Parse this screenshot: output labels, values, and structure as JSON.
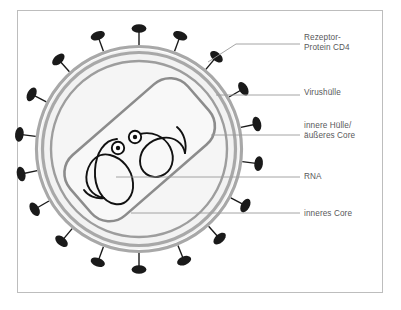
{
  "figure": {
    "frame": {
      "border_color": "#bdbdbd",
      "background": "#ffffff"
    }
  },
  "colors": {
    "envelope_gray": "#a8a8a8",
    "inner_ring_gray": "#9d9d9d",
    "core_gray": "#8c8c8c",
    "spike_black": "#1a1a1a",
    "cytoplasm_fill": "#f2f2f2",
    "core_fill": "#f7f7f7",
    "leader_line": "#9a9a9a",
    "text_gray": "#58585a"
  },
  "labels": [
    {
      "id": "cd4",
      "name": "receptor-protein-cd4",
      "text": "Rezeptor-\nProtein CD4"
    },
    {
      "id": "envelope",
      "name": "virus-envelope",
      "text": "Virushülle"
    },
    {
      "id": "inner",
      "name": "inner-envelope-outer-core",
      "text": "innere Hülle/\näußeres Core"
    },
    {
      "id": "rna",
      "name": "rna",
      "text": "RNA"
    },
    {
      "id": "core",
      "name": "inner-core",
      "text": "inneres Core"
    }
  ],
  "structure": {
    "center": {
      "x": 139,
      "y": 149
    },
    "envelope_outer_radius": 104,
    "envelope_inner_radius": 97,
    "inner_ring_radius": 88,
    "core_rotation_deg": -41,
    "spike_count": 18,
    "spike_label": "Rezeptor-Protein CD4 spike",
    "rna_strand_count": 2,
    "enzyme_dot_count": 2
  },
  "leaders": [
    {
      "id": "cd4",
      "type": "bent",
      "anchor_x": 208,
      "anchor_y": 62,
      "end_x": 300,
      "end_y": 36
    },
    {
      "id": "envelope",
      "type": "horizontal",
      "anchor_x": 216,
      "anchor_y": 95,
      "end_x": 300,
      "end_y": 95
    },
    {
      "id": "inner",
      "type": "horizontal",
      "anchor_x": 211,
      "anchor_y": 135,
      "end_x": 300,
      "end_y": 135
    },
    {
      "id": "rna",
      "type": "horizontal",
      "anchor_x": 116,
      "anchor_y": 177,
      "end_x": 300,
      "end_y": 177
    },
    {
      "id": "core",
      "type": "horizontal",
      "anchor_x": 131,
      "anchor_y": 213,
      "end_x": 300,
      "end_y": 213
    }
  ]
}
